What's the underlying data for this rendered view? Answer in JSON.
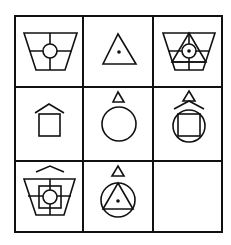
{
  "puzzle": {
    "type": "3x3 figure reasoning matrix",
    "grid": {
      "rows": 3,
      "cols": 3,
      "x_lines": [
        15,
        83,
        153,
        222
      ],
      "y_lines": [
        16,
        87,
        161,
        232
      ],
      "color": "#111111"
    },
    "cells": [
      {
        "row": 1,
        "col": 1,
        "description": "Trapezoid with cross lines and circle at center"
      },
      {
        "row": 1,
        "col": 2,
        "description": "Triangle with dot in center"
      },
      {
        "row": 1,
        "col": 3,
        "description": "Trapezoid with triangle, cross lines and circle with dot"
      },
      {
        "row": 2,
        "col": 1,
        "description": "Square with roof chevron above"
      },
      {
        "row": 2,
        "col": 2,
        "description": "Circle with small triangle above"
      },
      {
        "row": 2,
        "col": 3,
        "description": "Circle with inscribed square, roof chevron and small triangle above"
      },
      {
        "row": 3,
        "col": 1,
        "description": "Trapezoid with roof chevron, square, circle and cross lines"
      },
      {
        "row": 3,
        "col": 2,
        "description": "Circle with inscribed triangle, dot and small triangle above"
      },
      {
        "row": 3,
        "col": 3,
        "description": "Empty (answer cell)"
      }
    ]
  }
}
